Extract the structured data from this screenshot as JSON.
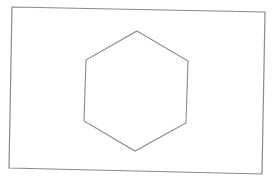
{
  "diagram": {
    "width": 273,
    "height": 179,
    "background": "#ffffff",
    "shapes": [
      {
        "type": "rectangle",
        "name": "outer-rectangle",
        "points": [
          [
            12,
            7
          ],
          [
            265,
            12
          ],
          [
            262,
            174
          ],
          [
            9,
            168
          ]
        ],
        "stroke": "#8a8a8a",
        "stroke_width": 1.2
      },
      {
        "type": "hexagon",
        "name": "inner-hexagon",
        "points": [
          [
            137,
            31
          ],
          [
            188,
            61
          ],
          [
            186,
            123
          ],
          [
            135,
            151
          ],
          [
            84,
            121
          ],
          [
            86,
            60
          ]
        ],
        "stroke": "#8a8a8a",
        "stroke_width": 1.1
      }
    ]
  }
}
